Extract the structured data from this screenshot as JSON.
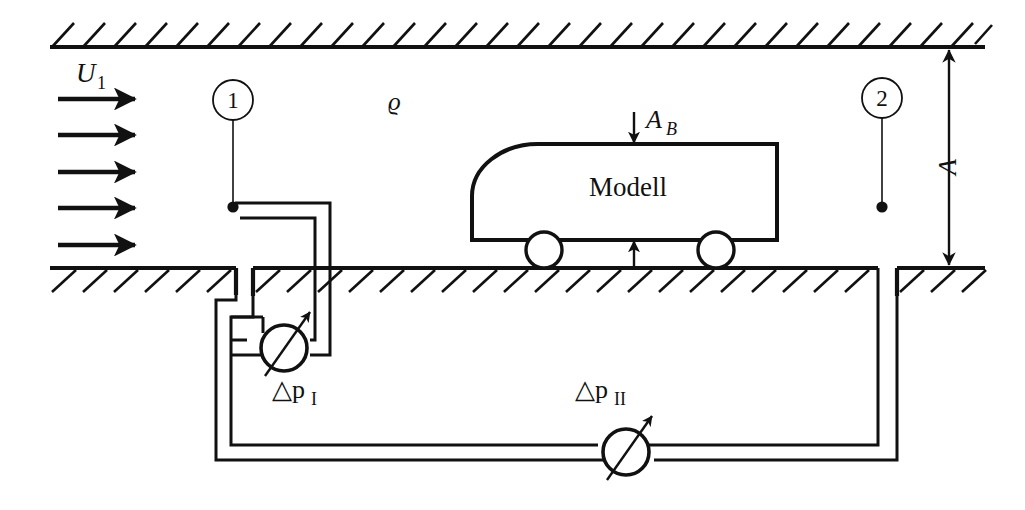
{
  "figure": {
    "background_color": "#ffffff",
    "line_color": "#111111",
    "width": 1025,
    "height": 510
  },
  "labels": {
    "inflow_velocity": "U",
    "inflow_velocity_sub": "1",
    "density": "ϱ",
    "model": "Modell",
    "frontal_area": "A",
    "frontal_area_sub": "B",
    "tunnel_height": "A",
    "delta_p_1": "△p",
    "delta_p_1_sub": "I",
    "delta_p_2": "△p",
    "delta_p_2_sub": "II",
    "station_1": "1",
    "station_2": "2"
  },
  "elements": {
    "top_wall": "hatched-top-wall",
    "bottom_wall": "hatched-bottom-wall",
    "flow_arrows_count": 5,
    "wheels_count": 2,
    "gauges_count": 2,
    "station_markers_count": 2,
    "dimension_line": "tunnel-height-A"
  },
  "icons": {
    "flow_arrow": "right-arrow-icon",
    "area_arrow_down": "down-arrow-icon",
    "gap_arrow_up": "up-arrow-icon",
    "dimension_arrow": "double-headed-vertical-arrow-icon",
    "gauge": "circular-manometer-icon"
  }
}
